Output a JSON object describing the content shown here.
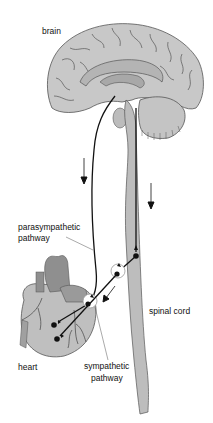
{
  "diagram": {
    "labels": {
      "brain": "brain",
      "parasympathetic_line1": "parasympathetic",
      "parasympathetic_line2": "pathway",
      "spinal_cord": "spinal cord",
      "heart": "heart",
      "sympathetic_line1": "sympathetic",
      "sympathetic_line2": "pathway"
    },
    "colors": {
      "brain_fill": "#c8c8c8",
      "brain_inner": "#b4b4b4",
      "cord_fill": "#bdbdbd",
      "heart_fill": "#bfbfbf",
      "heart_dark": "#8f8f8f",
      "nerve": "#111111",
      "leader": "#555555"
    }
  }
}
